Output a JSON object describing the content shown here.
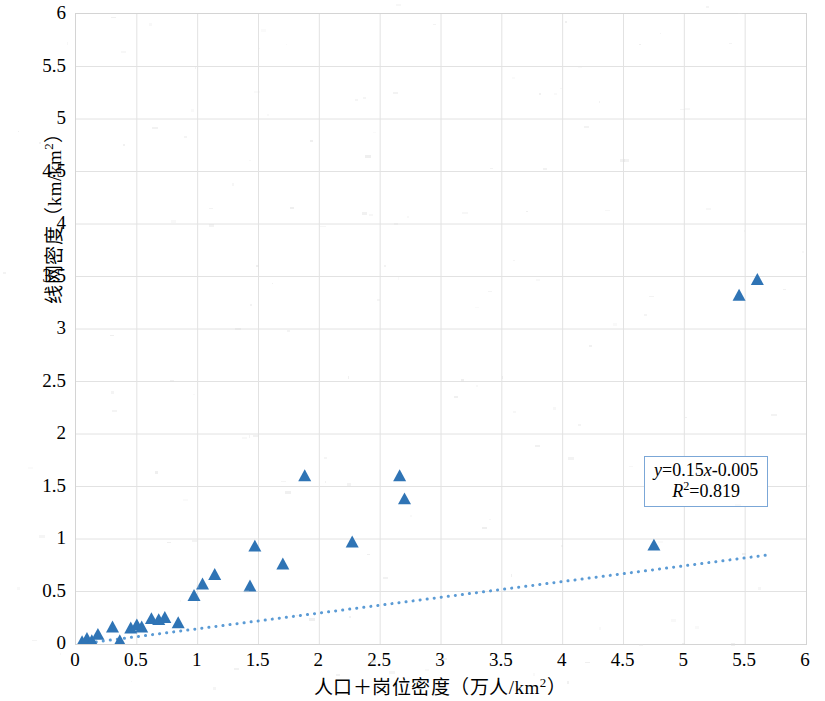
{
  "chart_data": {
    "type": "scatter",
    "title": "",
    "xlabel": "人口＋岗位密度（万人/km²）",
    "ylabel": "线网密度（km/km²）",
    "xlim": [
      0,
      6
    ],
    "ylim": [
      0,
      6
    ],
    "xticks": [
      0,
      0.5,
      1,
      1.5,
      2,
      2.5,
      3,
      3.5,
      4,
      4.5,
      5,
      5.5,
      6
    ],
    "yticks": [
      0,
      0.5,
      1,
      1.5,
      2,
      2.5,
      3,
      3.5,
      4,
      4.5,
      5,
      5.5,
      6
    ],
    "xtick_labels": [
      "0",
      "0.5",
      "1",
      "1.5",
      "2",
      "2.5",
      "3",
      "3.5",
      "4",
      "4.5",
      "5",
      "5.5",
      "6"
    ],
    "ytick_labels": [
      "0",
      "0.5",
      "1",
      "1.5",
      "2",
      "2.5",
      "3",
      "3.5",
      "4",
      "4.5",
      "5",
      "5.5",
      "6"
    ],
    "grid": true,
    "legend": "none",
    "marker": "triangle",
    "marker_color": "#2f74b5",
    "points": [
      {
        "x": 0.05,
        "y": 0.02
      },
      {
        "x": 0.09,
        "y": 0.05
      },
      {
        "x": 0.13,
        "y": 0.03
      },
      {
        "x": 0.18,
        "y": 0.09
      },
      {
        "x": 0.3,
        "y": 0.16
      },
      {
        "x": 0.36,
        "y": 0.03
      },
      {
        "x": 0.45,
        "y": 0.15
      },
      {
        "x": 0.5,
        "y": 0.18
      },
      {
        "x": 0.54,
        "y": 0.16
      },
      {
        "x": 0.62,
        "y": 0.24
      },
      {
        "x": 0.68,
        "y": 0.23
      },
      {
        "x": 0.73,
        "y": 0.25
      },
      {
        "x": 0.84,
        "y": 0.2
      },
      {
        "x": 0.97,
        "y": 0.46
      },
      {
        "x": 1.04,
        "y": 0.57
      },
      {
        "x": 1.14,
        "y": 0.66
      },
      {
        "x": 1.43,
        "y": 0.55
      },
      {
        "x": 1.47,
        "y": 0.93
      },
      {
        "x": 1.7,
        "y": 0.76
      },
      {
        "x": 1.88,
        "y": 1.6
      },
      {
        "x": 2.27,
        "y": 0.97
      },
      {
        "x": 2.66,
        "y": 1.6
      },
      {
        "x": 2.7,
        "y": 1.38
      },
      {
        "x": 4.75,
        "y": 0.94
      },
      {
        "x": 5.45,
        "y": 3.32
      },
      {
        "x": 5.6,
        "y": 3.47
      }
    ],
    "trendline": {
      "type": "linear",
      "style": "dotted",
      "color": "#5b9bd5",
      "slope": 0.15,
      "intercept": -0.005,
      "x_start": 0.05,
      "x_end": 5.72
    },
    "annotation": {
      "equation_prefix": "y",
      "equation_body": "=0.15",
      "equation_var": "x",
      "equation_tail": "-0.005",
      "r2_symbol": "R",
      "r2_sup": "2",
      "r2_value": "=0.819",
      "equation_text": "y=0.15x-0.005",
      "r2_text": "R²=0.819",
      "border_color": "#7ba7d7"
    }
  },
  "axis_titles": {
    "y_main": "线网密度（km/km",
    "y_sup": "2",
    "y_close": "）",
    "x_main": "人口＋岗位密度（万人/km",
    "x_sup": "2",
    "x_close": "）"
  }
}
